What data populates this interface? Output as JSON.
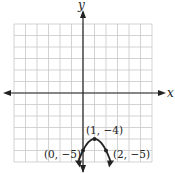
{
  "figure": {
    "x_axis_label": "x",
    "y_axis_label": "y",
    "grid": {
      "xmin": -6,
      "xmax": 6,
      "ymin": -6,
      "ymax": 6,
      "step": 1
    },
    "curve": {
      "type": "parabola",
      "equation": "y = -(x-1)^2 - 4",
      "vertex": [
        1,
        -4
      ]
    },
    "points": [
      {
        "label": "(1, −4)",
        "x": 1,
        "y": -4
      },
      {
        "label": "(0, −5)",
        "x": 0,
        "y": -5
      },
      {
        "label": "(2, −5)",
        "x": 2,
        "y": -5
      }
    ],
    "colors": {
      "grid": "#c8c8c8",
      "axis": "#222222",
      "curve": "#222222"
    }
  }
}
